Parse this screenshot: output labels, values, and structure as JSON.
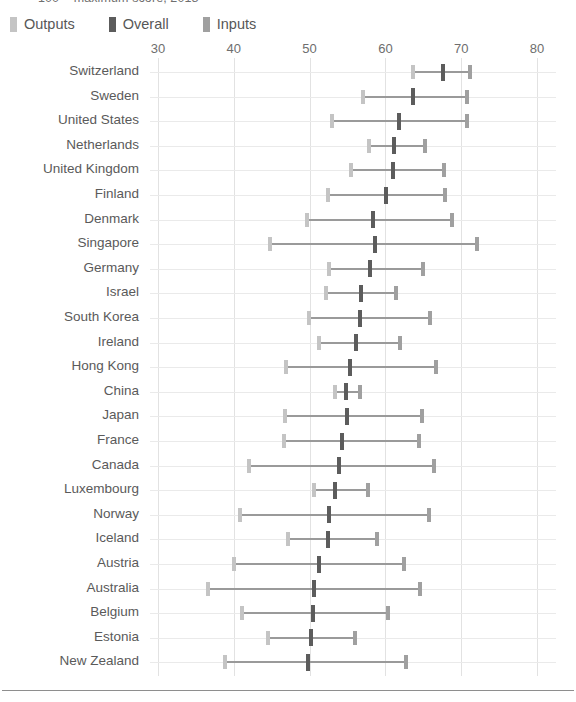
{
  "chart_title": "100 = maximum score, 2018",
  "legend": {
    "items": [
      {
        "label": "Outputs",
        "color": "#c4c4c4",
        "key": "outputs"
      },
      {
        "label": "Overall",
        "color": "#5c5c5c",
        "key": "overall"
      },
      {
        "label": "Inputs",
        "color": "#a0a0a0",
        "key": "inputs"
      }
    ]
  },
  "axis": {
    "ticks": [
      "30",
      "40",
      "50",
      "60",
      "70",
      "80"
    ],
    "min": 30,
    "max": 80
  },
  "chart_data": {
    "type": "scatter",
    "title": "100 = maximum score, 2018",
    "xlabel": "",
    "ylabel": "",
    "xlim": [
      30,
      80
    ],
    "grid": true,
    "legend_position": "top-left",
    "series": [
      {
        "name": "Outputs",
        "color": "#c4c4c4"
      },
      {
        "name": "Overall",
        "color": "#5c5c5c"
      },
      {
        "name": "Inputs",
        "color": "#a0a0a0"
      }
    ],
    "categories": [
      "Switzerland",
      "Sweden",
      "United States",
      "Netherlands",
      "United Kingdom",
      "Finland",
      "Denmark",
      "Singapore",
      "Germany",
      "Israel",
      "South Korea",
      "Ireland",
      "Hong Kong",
      "China",
      "Japan",
      "France",
      "Canada",
      "Luxembourg",
      "Norway",
      "Iceland",
      "Austria",
      "Australia",
      "Belgium",
      "Estonia",
      "New Zealand"
    ],
    "rows": [
      {
        "country": "Switzerland",
        "outputs": 63.7,
        "overall": 67.6,
        "inputs": 71.2
      },
      {
        "country": "Sweden",
        "outputs": 57.0,
        "overall": 63.6,
        "inputs": 70.7
      },
      {
        "country": "United States",
        "outputs": 53.0,
        "overall": 61.8,
        "inputs": 70.8
      },
      {
        "country": "Netherlands",
        "outputs": 57.8,
        "overall": 61.2,
        "inputs": 65.2
      },
      {
        "country": "United Kingdom",
        "outputs": 55.4,
        "overall": 61.0,
        "inputs": 67.7
      },
      {
        "country": "Finland",
        "outputs": 52.4,
        "overall": 60.1,
        "inputs": 67.9
      },
      {
        "country": "Denmark",
        "outputs": 49.6,
        "overall": 58.4,
        "inputs": 68.8
      },
      {
        "country": "Singapore",
        "outputs": 44.8,
        "overall": 58.6,
        "inputs": 72.1
      },
      {
        "country": "Germany",
        "outputs": 52.6,
        "overall": 58.0,
        "inputs": 64.9
      },
      {
        "country": "Israel",
        "outputs": 52.2,
        "overall": 56.8,
        "inputs": 61.4
      },
      {
        "country": "South Korea",
        "outputs": 49.9,
        "overall": 56.6,
        "inputs": 65.9
      },
      {
        "country": "Ireland",
        "outputs": 51.2,
        "overall": 56.1,
        "inputs": 61.9
      },
      {
        "country": "Hong Kong",
        "outputs": 46.9,
        "overall": 55.3,
        "inputs": 66.7
      },
      {
        "country": "China",
        "outputs": 53.4,
        "overall": 54.8,
        "inputs": 56.6
      },
      {
        "country": "Japan",
        "outputs": 46.7,
        "overall": 54.9,
        "inputs": 64.8
      },
      {
        "country": "France",
        "outputs": 46.6,
        "overall": 54.3,
        "inputs": 64.4
      },
      {
        "country": "Canada",
        "outputs": 42.0,
        "overall": 53.9,
        "inputs": 66.4
      },
      {
        "country": "Luxembourg",
        "outputs": 50.6,
        "overall": 53.4,
        "inputs": 57.7
      },
      {
        "country": "Norway",
        "outputs": 40.8,
        "overall": 52.6,
        "inputs": 65.8
      },
      {
        "country": "Iceland",
        "outputs": 47.2,
        "overall": 52.4,
        "inputs": 58.9
      },
      {
        "country": "Austria",
        "outputs": 40.0,
        "overall": 51.3,
        "inputs": 62.5
      },
      {
        "country": "Australia",
        "outputs": 36.6,
        "overall": 50.6,
        "inputs": 64.6
      },
      {
        "country": "Belgium",
        "outputs": 41.1,
        "overall": 50.5,
        "inputs": 60.4
      },
      {
        "country": "Estonia",
        "outputs": 44.5,
        "overall": 50.2,
        "inputs": 56.0
      },
      {
        "country": "New Zealand",
        "outputs": 38.9,
        "overall": 49.8,
        "inputs": 62.7
      }
    ]
  }
}
